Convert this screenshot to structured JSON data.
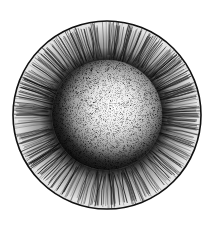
{
  "image": {
    "width": 212,
    "height": 235,
    "background": "#ffffff",
    "subject": "stippled iris illustration",
    "center": [
      107,
      115
    ],
    "outer_radius": 94,
    "ring_radius": 54,
    "highlight_center": [
      114,
      107
    ],
    "colors": {
      "ink": "#111111",
      "outer_fill": "#d8d8d8",
      "pupil_dark": "#0a0a0a",
      "highlight": "#ffffff"
    }
  }
}
